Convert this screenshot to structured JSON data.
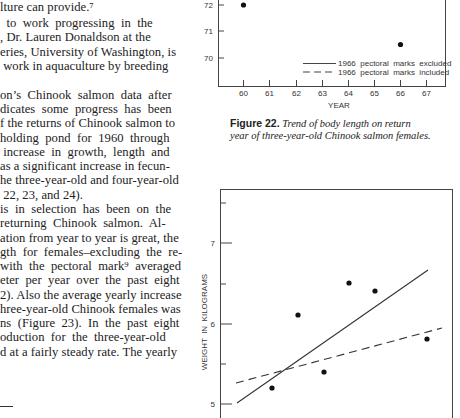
{
  "body_text": {
    "lines": [
      "lture can provide.⁷",
      "  to  work  progressing  in  the",
      ", Dr. Lauren Donaldson at the",
      "eries, University of Washington, is",
      " work in aquaculture by breeding",
      "",
      "on’s  Chinook  salmon  data  after",
      "dicates  some  progress  has  been",
      "f the returns of Chinook salmon to",
      "holding  pond  for  1960  through",
      " increase  in  growth,  length  and",
      "as a significant increase in fecun-",
      "he three-year-old and four-year-old",
      " 22, 23, and 24).",
      "is  in  selection  has  been  on  the",
      "returning  Chinook  salmon.  Al-",
      "ation from year to year is great, the",
      "gth  for  females–excluding  the  re-",
      "with  the  pectoral  mark⁹  averaged",
      "eter  per  year  over  the  past  eight",
      "2). Also the average yearly increase",
      "hree-year-old Chinook females was",
      "ns  (Figure  23).  In  the  past  eight",
      "oduction  for  the  three-year-old",
      "d at a fairly steady rate. The yearly"
    ]
  },
  "figure22": {
    "caption_label": "Figure 22.",
    "caption_text_1": "Trend of body length on return",
    "caption_text_2": "year of three-year-old Chinook salmon females.",
    "xlabel": "YEAR",
    "ytick_labels": [
      "72",
      "71",
      "70"
    ],
    "xtick_labels": [
      "60",
      "61",
      "62",
      "63",
      "64",
      "65",
      "66",
      "67"
    ],
    "legend": {
      "solid": "1966  pectoral  marks  excluded",
      "dashed": "1966  pectoral  marks  included"
    }
  },
  "figure23": {
    "ylabel": "WEIGHT  IN  KILOGRAMS",
    "ytick_labels": [
      "7",
      "6",
      "5"
    ]
  },
  "chart_data": [
    {
      "type": "scatter",
      "title": "Figure 22. Trend of body length on return year of three-year-old Chinook salmon females.",
      "xlabel": "YEAR",
      "ylabel": "",
      "x_ticks": [
        60,
        61,
        62,
        63,
        64,
        65,
        66,
        67
      ],
      "y_ticks": [
        70,
        71,
        72
      ],
      "points_visible": [
        {
          "x": 60,
          "y": 72.0
        },
        {
          "x": 66,
          "y": 70.5
        }
      ],
      "legend": [
        "1966 pectoral marks excluded (solid)",
        "1966 pectoral marks included (dashed)"
      ],
      "legend_position": "lower right",
      "grid": false,
      "note": "Chart is cropped; only upper portion of y-range visible."
    },
    {
      "type": "scatter",
      "title": "Weight trend (cropped, Figure 23)",
      "xlabel": "",
      "ylabel": "WEIGHT IN KILOGRAMS",
      "y_ticks": [
        5,
        6,
        7
      ],
      "ylim": [
        4.9,
        7.6
      ],
      "series": [
        {
          "name": "observed",
          "x": [
            60,
            61,
            62,
            63,
            64,
            66
          ],
          "values": [
            5.2,
            6.1,
            5.4,
            6.5,
            6.4,
            5.8
          ]
        },
        {
          "name": "trend excluding 1966 pectoral marks (solid)",
          "x": [
            59.5,
            66.5
          ],
          "values": [
            5.0,
            6.65
          ]
        },
        {
          "name": "trend including 1966 pectoral marks (dashed)",
          "x": [
            59.5,
            67
          ],
          "values": [
            5.25,
            5.95
          ]
        }
      ],
      "grid": false
    }
  ]
}
